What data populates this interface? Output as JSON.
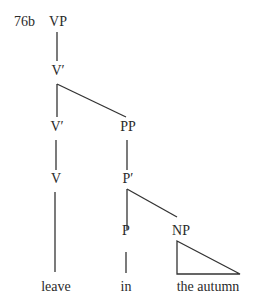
{
  "diagram": {
    "type": "syntax-tree",
    "example_number": "76b",
    "nodes": {
      "vp": "VP",
      "vbar_top": "V′",
      "vbar_lower": "V′",
      "pp": "PP",
      "v": "V",
      "pbar": "P′",
      "p": "P",
      "np": "NP"
    },
    "leaves": {
      "leave": "leave",
      "in": "in",
      "the_autumn": "the autumn"
    },
    "edges": [
      [
        "VP",
        "V′"
      ],
      [
        "V′",
        "V′ (lower)"
      ],
      [
        "V′",
        "PP"
      ],
      [
        "V′ (lower)",
        "V"
      ],
      [
        "V",
        "leave"
      ],
      [
        "PP",
        "P′"
      ],
      [
        "P′",
        "P"
      ],
      [
        "P′",
        "NP"
      ],
      [
        "P",
        "in"
      ],
      [
        "NP",
        "the autumn (triangle)"
      ]
    ],
    "colors": {
      "ink": "#2a2a2a",
      "background": "#ffffff"
    }
  }
}
